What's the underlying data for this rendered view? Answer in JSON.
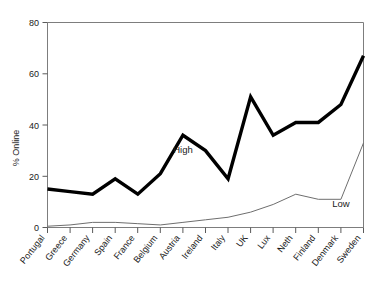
{
  "chart_data": {
    "type": "line",
    "title": "",
    "xlabel": "",
    "ylabel": "% Online",
    "ylim": [
      0,
      80
    ],
    "yticks": [
      0,
      20,
      40,
      60,
      80
    ],
    "ytick_labels": [
      "0",
      "20",
      "40",
      "60",
      "80"
    ],
    "grid": false,
    "legend": "inline-annotations",
    "categories": [
      "Portugal",
      "Greece",
      "Germany",
      "Spain",
      "France",
      "Belgium",
      "Austria",
      "Ireland",
      "Italy",
      "UK",
      "Lux",
      "Neth",
      "Finland",
      "Denmark",
      "Sweden"
    ],
    "series": [
      {
        "name": "High",
        "color": "#000000",
        "values": [
          15,
          14,
          13,
          19,
          13,
          21,
          36,
          30,
          19,
          51,
          36,
          41,
          41,
          48,
          67
        ]
      },
      {
        "name": "Low",
        "color": "#6e6e6e",
        "values": [
          0.5,
          1,
          2,
          2,
          1.5,
          1,
          2,
          3,
          4,
          6,
          9,
          13,
          11,
          11,
          33
        ]
      }
    ],
    "annotations": [
      {
        "text": "High",
        "category": "Austria",
        "value": 29
      },
      {
        "text": "Low",
        "category": "Denmark",
        "value": 8
      }
    ]
  },
  "axis": {
    "y_title": "% Online",
    "y_tick_0": "0",
    "y_tick_20": "20",
    "y_tick_40": "40",
    "y_tick_60": "60",
    "y_tick_80": "80"
  },
  "categories": {
    "c0": "Portugal",
    "c1": "Greece",
    "c2": "Germany",
    "c3": "Spain",
    "c4": "France",
    "c5": "Belgium",
    "c6": "Austria",
    "c7": "Ireland",
    "c8": "Italy",
    "c9": "UK",
    "c10": "Lux",
    "c11": "Neth",
    "c12": "Finland",
    "c13": "Denmark",
    "c14": "Sweden"
  },
  "annotations": {
    "high": "High",
    "low": "Low"
  }
}
